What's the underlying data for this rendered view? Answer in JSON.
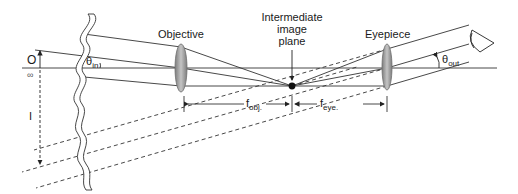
{
  "diagram": {
    "type": "optical ray diagram",
    "labels": {
      "objective": "Objective",
      "eyepiece": "Eyepiece",
      "intermediate_line1": "Intermediate",
      "intermediate_line2": "image",
      "intermediate_line3": "plane",
      "object_label": "O",
      "infinity": "∞",
      "image_label": "I",
      "theta_in_base": "θ",
      "theta_in_sub": "in",
      "theta_out_base": "θ",
      "theta_out_sub": "out",
      "f_obj_base": "f",
      "f_obj_sub": "obj.",
      "f_eye_base": "f",
      "f_eye_sub": "eye."
    },
    "elements": {
      "optical_axis": "horizontal line through lens centers",
      "objective_lens": "biconvex lens (gray)",
      "eyepiece_lens": "biconvex lens (gray)",
      "eye_icon": "eye viewing from right",
      "break_marks": "double wavy break lines",
      "focal_point": "black dot at intermediate image plane"
    },
    "colors": {
      "line": "#333333",
      "lens_fill": "#9a9a9a",
      "lens_edge": "#6e6e6e",
      "background": "#ffffff"
    }
  }
}
